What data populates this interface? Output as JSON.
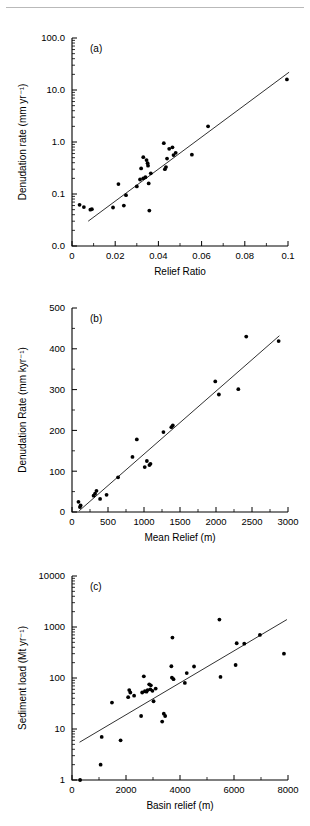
{
  "figure": {
    "background": "#ffffff",
    "rule_color": "#b9b9b9",
    "marker_color": "#000000",
    "line_color": "#1a1a1a"
  },
  "chart_data": [
    {
      "id": "panel-a",
      "type": "scatter",
      "panel_label": "(a)",
      "title": "",
      "xlabel": "Relief Ratio",
      "ylabel": "Denudation rate (mm yr⁻¹)",
      "xscale": "linear",
      "yscale": "log",
      "xlim": [
        0,
        0.1
      ],
      "ylim": [
        0.01,
        100
      ],
      "xticks": [
        0,
        0.02,
        0.04,
        0.06,
        0.08,
        0.1
      ],
      "xticklabels": [
        "0",
        "0.02",
        "0.04",
        "0.06",
        "0.08",
        "0.1"
      ],
      "yticks": [
        0.01,
        0.1,
        1,
        10,
        100
      ],
      "yticklabels": [
        "0.0",
        "0.1",
        "1.0",
        "10.0",
        "100.0"
      ],
      "grid": false,
      "legend": "none",
      "points": [
        [
          0.0035,
          0.062
        ],
        [
          0.0055,
          0.056
        ],
        [
          0.0085,
          0.05
        ],
        [
          0.0092,
          0.051
        ],
        [
          0.019,
          0.055
        ],
        [
          0.0215,
          0.155
        ],
        [
          0.024,
          0.06
        ],
        [
          0.025,
          0.095
        ],
        [
          0.03,
          0.14
        ],
        [
          0.0315,
          0.19
        ],
        [
          0.032,
          0.31
        ],
        [
          0.033,
          0.2
        ],
        [
          0.034,
          0.21
        ],
        [
          0.0345,
          0.45
        ],
        [
          0.035,
          0.39
        ],
        [
          0.0352,
          0.35
        ],
        [
          0.0355,
          0.16
        ],
        [
          0.0358,
          0.048
        ],
        [
          0.033,
          0.51
        ],
        [
          0.0365,
          0.25
        ],
        [
          0.0425,
          0.95
        ],
        [
          0.043,
          0.3
        ],
        [
          0.0435,
          0.33
        ],
        [
          0.044,
          0.48
        ],
        [
          0.045,
          0.74
        ],
        [
          0.0465,
          0.79
        ],
        [
          0.047,
          0.56
        ],
        [
          0.048,
          0.62
        ],
        [
          0.0555,
          0.57
        ],
        [
          0.063,
          2.0
        ],
        [
          0.0995,
          16.0
        ]
      ],
      "fit_line": {
        "x": [
          0.0075,
          0.1005
        ],
        "y": [
          0.03,
          22.0
        ]
      }
    },
    {
      "id": "panel-b",
      "type": "scatter",
      "panel_label": "(b)",
      "title": "",
      "xlabel": "Mean Relief (m)",
      "ylabel": "Denudation Rate (mm kyr⁻¹)",
      "xscale": "linear",
      "yscale": "linear",
      "xlim": [
        0,
        3000
      ],
      "ylim": [
        0,
        500
      ],
      "xticks": [
        0,
        500,
        1000,
        1500,
        2000,
        2500,
        3000
      ],
      "xticklabels": [
        "0",
        "500",
        "1000",
        "1500",
        "2000",
        "2500",
        "3000"
      ],
      "yticks": [
        0,
        100,
        200,
        300,
        400,
        500
      ],
      "yticklabels": [
        "0",
        "100",
        "200",
        "300",
        "400",
        "500"
      ],
      "grid": false,
      "legend": "none",
      "points": [
        [
          90,
          25
        ],
        [
          110,
          12
        ],
        [
          120,
          16
        ],
        [
          300,
          40
        ],
        [
          320,
          45
        ],
        [
          340,
          52
        ],
        [
          390,
          32
        ],
        [
          480,
          42
        ],
        [
          640,
          85
        ],
        [
          840,
          135
        ],
        [
          900,
          178
        ],
        [
          1010,
          110
        ],
        [
          1040,
          125
        ],
        [
          1075,
          115
        ],
        [
          1090,
          118
        ],
        [
          1270,
          196
        ],
        [
          1380,
          208
        ],
        [
          1400,
          212
        ],
        [
          1990,
          320
        ],
        [
          2040,
          288
        ],
        [
          2310,
          301
        ],
        [
          2420,
          430
        ],
        [
          2870,
          419
        ]
      ],
      "fit_line": {
        "x": [
          100,
          2880
        ],
        "y": [
          3,
          432
        ]
      }
    },
    {
      "id": "panel-c",
      "type": "scatter",
      "panel_label": "(c)",
      "title": "",
      "xlabel": "Basin relief (m)",
      "ylabel": "Sediment load (Mt yr⁻¹)",
      "xscale": "linear",
      "yscale": "log",
      "xlim": [
        0,
        8000
      ],
      "ylim": [
        1,
        10000
      ],
      "xticks": [
        0,
        2000,
        4000,
        6000,
        8000
      ],
      "xticklabels": [
        "0",
        "2000",
        "4000",
        "6000",
        "8000"
      ],
      "yticks": [
        1,
        10,
        100,
        1000,
        10000
      ],
      "yticklabels": [
        "1",
        "10",
        "100",
        "1000",
        "10000"
      ],
      "grid": false,
      "legend": "none",
      "points": [
        [
          300,
          1.0
        ],
        [
          1060,
          2.0
        ],
        [
          1100,
          7.0
        ],
        [
          1480,
          33
        ],
        [
          1800,
          6.0
        ],
        [
          2080,
          42
        ],
        [
          2120,
          58
        ],
        [
          2160,
          52
        ],
        [
          2300,
          45
        ],
        [
          2560,
          18
        ],
        [
          2600,
          52
        ],
        [
          2660,
          108
        ],
        [
          2700,
          55
        ],
        [
          2760,
          54
        ],
        [
          2800,
          58
        ],
        [
          2860,
          75
        ],
        [
          2900,
          60
        ],
        [
          2920,
          72
        ],
        [
          2980,
          56
        ],
        [
          3020,
          35
        ],
        [
          3100,
          62
        ],
        [
          3340,
          14
        ],
        [
          3400,
          20
        ],
        [
          3450,
          18
        ],
        [
          3680,
          170
        ],
        [
          3700,
          102
        ],
        [
          3720,
          620
        ],
        [
          3760,
          95
        ],
        [
          4180,
          80
        ],
        [
          4250,
          125
        ],
        [
          4520,
          168
        ],
        [
          5460,
          1400
        ],
        [
          5500,
          105
        ],
        [
          6060,
          180
        ],
        [
          6100,
          480
        ],
        [
          6380,
          470
        ],
        [
          6960,
          700
        ],
        [
          7850,
          300
        ]
      ],
      "fit_line": {
        "x": [
          280,
          7960
        ],
        "y": [
          5.5,
          1400
        ]
      }
    }
  ]
}
